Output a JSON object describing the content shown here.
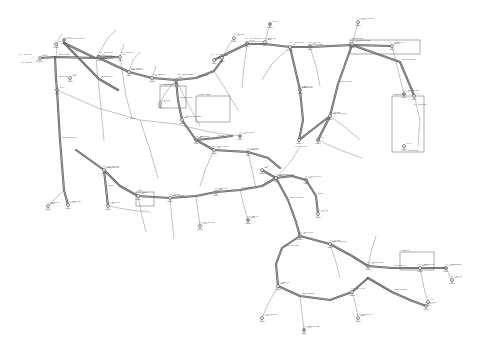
{
  "document": {
    "type": "cad-network-layout-drawing",
    "title": "Utility Distribution Network Layout Plan",
    "sheet_background": "#ffffff",
    "line_color": "#4a4a4a",
    "text_color": "#4f4f4f",
    "canvas": {
      "width": 480,
      "height": 347
    }
  },
  "legend_note": "Double-line trunk mains with junction nodes, valve/hydrant symbols, dimension ticks and leader-line callouts",
  "trunk_mains": [
    {
      "id": "M01",
      "label": "NORTH TRUNK MAIN",
      "points": "64,43 95,58 114,57"
    },
    {
      "id": "M02",
      "label": "RIDGE BRANCH",
      "points": "64,43 99,79 118,90"
    },
    {
      "id": "M03",
      "label": "WEST HEADER",
      "points": "40,58 56,57 96,58 120,57"
    },
    {
      "id": "M04",
      "label": "WEST RISER",
      "points": "55,57 56,79 57,90"
    },
    {
      "id": "M05",
      "label": "MAIN DIAGONAL",
      "points": "99,58 129,72 152,78 176,80"
    },
    {
      "id": "M06",
      "label": "CENTRE LINK",
      "points": "176,80 196,78 214,71 222,60"
    },
    {
      "id": "M07",
      "label": "UPPER EAST MAIN",
      "points": "214,60 247,44 265,44 290,47"
    },
    {
      "id": "M08",
      "label": "EAST HEADER",
      "points": "290,47 310,47 352,45 392,46"
    },
    {
      "id": "M09",
      "label": "NORTHEAST LOOP",
      "points": "352,45 400,62 414,95"
    },
    {
      "id": "M10",
      "label": "EAST RETURN",
      "points": "290,47 300,90 303,120 299,140"
    },
    {
      "id": "M11",
      "label": "EAST PLANT TIE",
      "points": "352,45 338,84 330,116 318,140"
    },
    {
      "id": "M12",
      "label": "SOUTHEAST SPUR",
      "points": "299,140 330,116"
    },
    {
      "id": "M13",
      "label": "CENTRAL SPINE",
      "points": "176,80 178,100 182,120 196,140 214,150"
    },
    {
      "id": "M14",
      "label": "MID TRUNK",
      "points": "214,150 248,152 268,158 280,168"
    },
    {
      "id": "M15",
      "label": "LOWER WEST MAIN",
      "points": "57,90 60,140 64,190 68,205"
    },
    {
      "id": "M16",
      "label": "SOUTH WEST TIE",
      "points": "76,150 104,170 120,186 138,196"
    },
    {
      "id": "M17",
      "label": "SOUTH HEADER",
      "points": "138,196 170,198 196,196 216,192"
    },
    {
      "id": "M18",
      "label": "PLANT FEED",
      "points": "216,192 240,190 262,186 276,178"
    },
    {
      "id": "M19",
      "label": "CENTRAL JUNCTION",
      "points": "262,170 276,178 292,176 306,180"
    },
    {
      "id": "M20",
      "label": "SOUTH DIAGONAL",
      "points": "276,178 288,200 296,222 300,236"
    },
    {
      "id": "M21",
      "label": "SOUTH LOOP WEST",
      "points": "300,236 282,248 276,264 278,286"
    },
    {
      "id": "M22",
      "label": "SOUTH LOOP EAST",
      "points": "300,236 330,244 352,256 368,266"
    },
    {
      "id": "M23",
      "label": "SOUTH RETURN",
      "points": "278,286 300,296 330,300 352,292 368,278"
    },
    {
      "id": "M24",
      "label": "EAST OUTFALL",
      "points": "368,266 392,268 420,268 446,268"
    },
    {
      "id": "M25",
      "label": "SOUTH EAST TIE",
      "points": "368,278 392,292 410,300 426,306"
    },
    {
      "id": "M26",
      "label": "SPUR A",
      "points": "306,180 316,196 318,214"
    },
    {
      "id": "M27",
      "label": "SPUR B",
      "points": "196,140 216,138 232,136"
    },
    {
      "id": "M28",
      "label": "SPUR C",
      "points": "104,170 106,188 108,206"
    }
  ],
  "thin_lines": [
    {
      "id": "T01",
      "points": "40,58 36,62"
    },
    {
      "id": "T02",
      "points": "56,57 58,40 62,34"
    },
    {
      "id": "T03",
      "points": "96,58 108,38 116,30"
    },
    {
      "id": "T04",
      "points": "120,57 124,44"
    },
    {
      "id": "T05",
      "points": "129,72 133,60 140,52"
    },
    {
      "id": "T06",
      "points": "152,78 156,66"
    },
    {
      "id": "T07",
      "points": "120,57 126,96 132,118"
    },
    {
      "id": "T08",
      "points": "57,90 98,108 140,120 176,124"
    },
    {
      "id": "T09",
      "points": "176,124 210,132 240,136"
    },
    {
      "id": "T10",
      "points": "96,58 100,98 104,140"
    },
    {
      "id": "T11",
      "points": "140,120 150,150 158,178"
    },
    {
      "id": "T12",
      "points": "176,80 188,104 200,126"
    },
    {
      "id": "T13",
      "points": "214,71 226,90 238,110"
    },
    {
      "id": "T14",
      "points": "247,44 244,66 242,88"
    },
    {
      "id": "T15",
      "points": "290,47 272,64 262,80"
    },
    {
      "id": "T16",
      "points": "310,47 316,66 320,86"
    },
    {
      "id": "T17",
      "points": "392,46 398,70 404,94"
    },
    {
      "id": "T18",
      "points": "414,95 420,120 418,146"
    },
    {
      "id": "T19",
      "points": "330,116 346,128 360,140"
    },
    {
      "id": "T20",
      "points": "318,140 340,150 362,158"
    },
    {
      "id": "T21",
      "points": "214,150 206,168 200,186"
    },
    {
      "id": "T22",
      "points": "248,152 252,170 256,188"
    },
    {
      "id": "T23",
      "points": "276,178 292,160 300,146"
    },
    {
      "id": "T24",
      "points": "138,196 142,216 146,232"
    },
    {
      "id": "T25",
      "points": "170,198 172,220 174,238"
    },
    {
      "id": "T26",
      "points": "278,286 268,304 262,318"
    },
    {
      "id": "T27",
      "points": "300,296 302,314 304,330"
    },
    {
      "id": "T28",
      "points": "330,244 336,262 340,278"
    },
    {
      "id": "T29",
      "points": "368,266 372,248 376,236"
    },
    {
      "id": "T30",
      "points": "420,268 424,288 428,302"
    },
    {
      "id": "T31",
      "points": "446,268 452,280"
    },
    {
      "id": "T32",
      "points": "64,190 54,200 48,206"
    },
    {
      "id": "T33",
      "points": "108,206 130,210 150,212"
    },
    {
      "id": "T34",
      "points": "196,196 198,212 200,226"
    },
    {
      "id": "T35",
      "points": "240,190 244,206 248,220"
    },
    {
      "id": "T36",
      "points": "352,292 356,306 358,318"
    },
    {
      "id": "T37",
      "points": "222,60 228,46 234,38"
    },
    {
      "id": "T38",
      "points": "265,44 268,30 270,24"
    },
    {
      "id": "T39",
      "points": "352,45 356,30 358,22"
    },
    {
      "id": "T40",
      "points": "176,80 166,92 160,104"
    }
  ],
  "frames": [
    {
      "id": "F1",
      "label": "PUMP HOUSE",
      "x": 160,
      "y": 86,
      "w": 26,
      "h": 22
    },
    {
      "id": "F2",
      "label": "VALVE CHAMBER",
      "x": 196,
      "y": 96,
      "w": 34,
      "h": 26
    },
    {
      "id": "F3",
      "label": "CONTROL BLDG",
      "x": 350,
      "y": 40,
      "w": 70,
      "h": 14
    },
    {
      "id": "F4",
      "label": "RESERVOIR",
      "x": 392,
      "y": 96,
      "w": 32,
      "h": 56
    },
    {
      "id": "F5",
      "label": "METER PIT",
      "x": 400,
      "y": 252,
      "w": 34,
      "h": 18
    },
    {
      "id": "F6",
      "label": "SUMP",
      "x": 136,
      "y": 192,
      "w": 18,
      "h": 14
    }
  ],
  "nodes": [
    {
      "id": "N01",
      "sym": "ring",
      "x": 64,
      "y": 40,
      "label": "MH-01"
    },
    {
      "id": "N02",
      "sym": "ring",
      "x": 40,
      "y": 58,
      "label": "MH-02"
    },
    {
      "id": "N03",
      "sym": "ring",
      "x": 56,
      "y": 44,
      "label": "V-12"
    },
    {
      "id": "N04",
      "sym": "ring",
      "x": 99,
      "y": 57,
      "label": "J-04"
    },
    {
      "id": "N05",
      "sym": "ring",
      "x": 120,
      "y": 57,
      "label": "J-05"
    },
    {
      "id": "N06",
      "sym": "ring",
      "x": 70,
      "y": 78,
      "label": "V-08"
    },
    {
      "id": "N07",
      "sym": "ring",
      "x": 57,
      "y": 90,
      "label": "MH-07"
    },
    {
      "id": "N08",
      "sym": "ring",
      "x": 129,
      "y": 72,
      "label": "J-08"
    },
    {
      "id": "N09",
      "sym": "ring",
      "x": 152,
      "y": 78,
      "label": "J-09"
    },
    {
      "id": "N10",
      "sym": "ring",
      "x": 176,
      "y": 80,
      "label": "J-10"
    },
    {
      "id": "N11",
      "sym": "ring",
      "x": 214,
      "y": 60,
      "label": "J-11"
    },
    {
      "id": "N12",
      "sym": "ring",
      "x": 222,
      "y": 58,
      "label": "V-22"
    },
    {
      "id": "N13",
      "sym": "ring",
      "x": 247,
      "y": 43,
      "label": "MH-13"
    },
    {
      "id": "N14",
      "sym": "ring",
      "x": 265,
      "y": 42,
      "label": "MH-14"
    },
    {
      "id": "N15",
      "sym": "ring",
      "x": 290,
      "y": 47,
      "label": "J-15"
    },
    {
      "id": "N16",
      "sym": "ring",
      "x": 310,
      "y": 46,
      "label": "V-31"
    },
    {
      "id": "N17",
      "sym": "ring",
      "x": 352,
      "y": 44,
      "label": "J-17"
    },
    {
      "id": "N18",
      "sym": "ring",
      "x": 392,
      "y": 46,
      "label": "MH-18"
    },
    {
      "id": "N19",
      "sym": "ring",
      "x": 404,
      "y": 94,
      "label": "J-19"
    },
    {
      "id": "N20",
      "sym": "ring",
      "x": 414,
      "y": 96,
      "label": "V-40"
    },
    {
      "id": "N21",
      "sym": "ring",
      "x": 404,
      "y": 146,
      "label": "MH-21"
    },
    {
      "id": "N22",
      "sym": "ring",
      "x": 300,
      "y": 90,
      "label": "J-22"
    },
    {
      "id": "N23",
      "sym": "ring",
      "x": 299,
      "y": 140,
      "label": "J-23"
    },
    {
      "id": "N24",
      "sym": "ring",
      "x": 330,
      "y": 116,
      "label": "V-27"
    },
    {
      "id": "N25",
      "sym": "ring",
      "x": 318,
      "y": 140,
      "label": "J-25"
    },
    {
      "id": "N26",
      "sym": "ring",
      "x": 182,
      "y": 120,
      "label": "J-26"
    },
    {
      "id": "N27",
      "sym": "ring",
      "x": 214,
      "y": 150,
      "label": "J-27"
    },
    {
      "id": "N28",
      "sym": "ring",
      "x": 248,
      "y": 152,
      "label": "V-19"
    },
    {
      "id": "N29",
      "sym": "ring",
      "x": 276,
      "y": 178,
      "label": "J-29"
    },
    {
      "id": "N30",
      "sym": "ring",
      "x": 262,
      "y": 170,
      "label": "J-30"
    },
    {
      "id": "N31",
      "sym": "ring",
      "x": 306,
      "y": 180,
      "label": "MH-31"
    },
    {
      "id": "N32",
      "sym": "ring",
      "x": 138,
      "y": 196,
      "label": "J-32"
    },
    {
      "id": "N33",
      "sym": "ring",
      "x": 170,
      "y": 198,
      "label": "V-14"
    },
    {
      "id": "N34",
      "sym": "ring",
      "x": 216,
      "y": 192,
      "label": "J-34"
    },
    {
      "id": "N35",
      "sym": "ring",
      "x": 104,
      "y": 170,
      "label": "MH-35"
    },
    {
      "id": "N36",
      "sym": "ring",
      "x": 68,
      "y": 205,
      "label": "MH-36"
    },
    {
      "id": "N37",
      "sym": "ring",
      "x": 300,
      "y": 236,
      "label": "J-37"
    },
    {
      "id": "N38",
      "sym": "ring",
      "x": 278,
      "y": 286,
      "label": "J-38"
    },
    {
      "id": "N39",
      "sym": "ring",
      "x": 330,
      "y": 244,
      "label": "V-44"
    },
    {
      "id": "N40",
      "sym": "ring",
      "x": 368,
      "y": 266,
      "label": "J-40"
    },
    {
      "id": "N41",
      "sym": "ring",
      "x": 352,
      "y": 292,
      "label": "J-41"
    },
    {
      "id": "N42",
      "sym": "ring",
      "x": 420,
      "y": 268,
      "label": "MH-42"
    },
    {
      "id": "N43",
      "sym": "ring",
      "x": 446,
      "y": 268,
      "label": "MH-43"
    },
    {
      "id": "N44",
      "sym": "ring",
      "x": 426,
      "y": 306,
      "label": "MH-44"
    },
    {
      "id": "N45",
      "sym": "ring",
      "x": 108,
      "y": 206,
      "label": "J-45"
    },
    {
      "id": "N46",
      "sym": "ring",
      "x": 196,
      "y": 140,
      "label": "J-46"
    },
    {
      "id": "N47",
      "sym": "ring",
      "x": 318,
      "y": 214,
      "label": "V-51"
    },
    {
      "id": "N48",
      "sym": "ring",
      "x": 262,
      "y": 318,
      "label": "MH-48"
    },
    {
      "id": "N49",
      "sym": "ring",
      "x": 304,
      "y": 330,
      "label": "MH-49"
    },
    {
      "id": "N50",
      "sym": "ring",
      "x": 358,
      "y": 318,
      "label": "MH-50"
    },
    {
      "id": "N51",
      "sym": "ring",
      "x": 234,
      "y": 38,
      "label": "V-03"
    },
    {
      "id": "N52",
      "sym": "ring",
      "x": 270,
      "y": 24,
      "label": "MH-52"
    },
    {
      "id": "N53",
      "sym": "ring",
      "x": 358,
      "y": 22,
      "label": "MH-53"
    },
    {
      "id": "N54",
      "sym": "ring",
      "x": 48,
      "y": 206,
      "label": "MH-54"
    },
    {
      "id": "N55",
      "sym": "ring",
      "x": 240,
      "y": 136,
      "label": "J-55"
    },
    {
      "id": "N56",
      "sym": "ring",
      "x": 160,
      "y": 104,
      "label": "V-61"
    },
    {
      "id": "N57",
      "sym": "ring",
      "x": 200,
      "y": 226,
      "label": "MH-57"
    },
    {
      "id": "N58",
      "sym": "ring",
      "x": 248,
      "y": 220,
      "label": "MH-58"
    },
    {
      "id": "N59",
      "sym": "ring",
      "x": 452,
      "y": 280,
      "label": "MH-59"
    },
    {
      "id": "N60",
      "sym": "ring",
      "x": 428,
      "y": 302,
      "label": "V-66"
    }
  ],
  "callouts": [
    {
      "id": "C01",
      "x": 70,
      "y": 38,
      "text": "EX MH RIM 104.2"
    },
    {
      "id": "C02",
      "x": 24,
      "y": 54,
      "text": "STA 0+00"
    },
    {
      "id": "C03",
      "x": 104,
      "y": 52,
      "text": "300 DIA DI"
    },
    {
      "id": "C04",
      "x": 126,
      "y": 52,
      "text": "INV 98.6"
    },
    {
      "id": "C05",
      "x": 136,
      "y": 68,
      "text": "250 DIA"
    },
    {
      "id": "C06",
      "x": 158,
      "y": 74,
      "text": "BEND 45"
    },
    {
      "id": "C07",
      "x": 182,
      "y": 74,
      "text": "TEE 300x200"
    },
    {
      "id": "C08",
      "x": 216,
      "y": 54,
      "text": "GV 300"
    },
    {
      "id": "C09",
      "x": 250,
      "y": 38,
      "text": "MH RIM 101.8"
    },
    {
      "id": "C10",
      "x": 268,
      "y": 38,
      "text": "STA 4+20"
    },
    {
      "id": "C11",
      "x": 294,
      "y": 42,
      "text": "400 DIA STL"
    },
    {
      "id": "C12",
      "x": 314,
      "y": 42,
      "text": "GV 400"
    },
    {
      "id": "C13",
      "x": 356,
      "y": 40,
      "text": "CONTROL BLDG"
    },
    {
      "id": "C14",
      "x": 394,
      "y": 42,
      "text": "MH RIM 99.4"
    },
    {
      "id": "C15",
      "x": 408,
      "y": 90,
      "text": "RESERVOIR"
    },
    {
      "id": "C16",
      "x": 418,
      "y": 104,
      "text": "TWL 112.0"
    },
    {
      "id": "C17",
      "x": 408,
      "y": 150,
      "text": "OUTLET 450"
    },
    {
      "id": "C18",
      "x": 304,
      "y": 86,
      "text": "STA 6+40"
    },
    {
      "id": "C19",
      "x": 334,
      "y": 112,
      "text": "GV 250"
    },
    {
      "id": "C20",
      "x": 300,
      "y": 146,
      "text": "INV 94.2"
    },
    {
      "id": "C21",
      "x": 186,
      "y": 116,
      "text": "VALVE CHAMBER"
    },
    {
      "id": "C22",
      "x": 164,
      "y": 84,
      "text": "PUMP HOUSE"
    },
    {
      "id": "C23",
      "x": 218,
      "y": 146,
      "text": "200 DIA PVC"
    },
    {
      "id": "C24",
      "x": 252,
      "y": 148,
      "text": "GV 200"
    },
    {
      "id": "C25",
      "x": 280,
      "y": 174,
      "text": "JUNCTION 4-WAY"
    },
    {
      "id": "C26",
      "x": 310,
      "y": 176,
      "text": "MH RIM 96.1"
    },
    {
      "id": "C27",
      "x": 142,
      "y": 192,
      "text": "SUMP"
    },
    {
      "id": "C28",
      "x": 174,
      "y": 194,
      "text": "GV 150"
    },
    {
      "id": "C29",
      "x": 220,
      "y": 188,
      "text": "STA 9+80"
    },
    {
      "id": "C30",
      "x": 108,
      "y": 166,
      "text": "MH RIM 97.5"
    },
    {
      "id": "C31",
      "x": 72,
      "y": 201,
      "text": "END LINE"
    },
    {
      "id": "C32",
      "x": 304,
      "y": 232,
      "text": "STA 12+00"
    },
    {
      "id": "C33",
      "x": 334,
      "y": 240,
      "text": "GV 300"
    },
    {
      "id": "C34",
      "x": 372,
      "y": 262,
      "text": "TEE 300x150"
    },
    {
      "id": "C35",
      "x": 424,
      "y": 264,
      "text": "METER PIT"
    },
    {
      "id": "C36",
      "x": 450,
      "y": 264,
      "text": "CONNECT EX"
    },
    {
      "id": "C37",
      "x": 282,
      "y": 282,
      "text": "INV 92.8"
    },
    {
      "id": "C38",
      "x": 356,
      "y": 288,
      "text": "STA 14+60"
    },
    {
      "id": "C39",
      "x": 430,
      "y": 302,
      "text": "GV 150"
    },
    {
      "id": "C40",
      "x": 112,
      "y": 202,
      "text": "STA 2+60"
    },
    {
      "id": "C41",
      "x": 200,
      "y": 136,
      "text": "BEND 22.5"
    },
    {
      "id": "C42",
      "x": 244,
      "y": 132,
      "text": "AIR VALVE"
    },
    {
      "id": "C43",
      "x": 164,
      "y": 100,
      "text": "GV 250"
    },
    {
      "id": "C44",
      "x": 238,
      "y": 34,
      "text": "GV 200"
    },
    {
      "id": "C45",
      "x": 362,
      "y": 18,
      "text": "MH RIM 100.2"
    },
    {
      "id": "C46",
      "x": 52,
      "y": 202,
      "text": "STA 0+00"
    },
    {
      "id": "C47",
      "x": 204,
      "y": 222,
      "text": "MH RIM 95.0"
    },
    {
      "id": "C48",
      "x": 252,
      "y": 216,
      "text": "INV 90.4"
    },
    {
      "id": "C49",
      "x": 266,
      "y": 314,
      "text": "MH RIM 93.6"
    },
    {
      "id": "C50",
      "x": 308,
      "y": 326,
      "text": "END OF LINE"
    },
    {
      "id": "C51",
      "x": 362,
      "y": 314,
      "text": "MH RIM 94.1"
    },
    {
      "id": "C52",
      "x": 26,
      "y": 62,
      "text": "BEGIN"
    },
    {
      "id": "C53",
      "x": 130,
      "y": 118,
      "text": "150 DIA"
    },
    {
      "id": "C54",
      "x": 322,
      "y": 210,
      "text": "GV 150"
    },
    {
      "id": "C55",
      "x": 456,
      "y": 276,
      "text": "EX 400"
    }
  ]
}
